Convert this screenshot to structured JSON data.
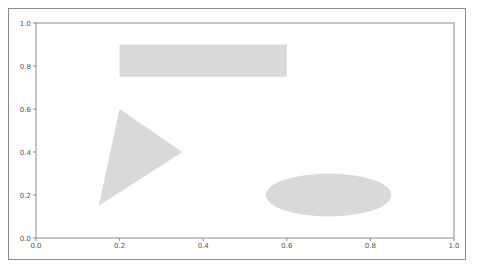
{
  "chart_data": {
    "type": "shapes",
    "title": "",
    "xlabel": "",
    "ylabel": "",
    "xlim": [
      0.0,
      1.0
    ],
    "ylim": [
      0.0,
      1.0
    ],
    "grid": false,
    "legend": null,
    "x_ticks": [
      "0.0",
      "0.2",
      "0.4",
      "0.6",
      "0.8",
      "1.0"
    ],
    "y_ticks": [
      "0.0",
      "0.2",
      "0.4",
      "0.6",
      "0.8",
      "1.0"
    ],
    "shapes": [
      {
        "kind": "rectangle",
        "x": 0.2,
        "y": 0.75,
        "width": 0.4,
        "height": 0.15,
        "color": "#d9d9d9"
      },
      {
        "kind": "triangle",
        "points": [
          [
            0.15,
            0.15
          ],
          [
            0.2,
            0.6
          ],
          [
            0.35,
            0.4
          ]
        ],
        "color": "#d9d9d9"
      },
      {
        "kind": "ellipse",
        "center": [
          0.7,
          0.2
        ],
        "width": 0.3,
        "height": 0.2,
        "color": "#d9d9d9"
      }
    ]
  },
  "colors": {
    "shape_fill": "#d9d9d9",
    "axis": "#8a8a8a",
    "tick_label": "#555555"
  }
}
